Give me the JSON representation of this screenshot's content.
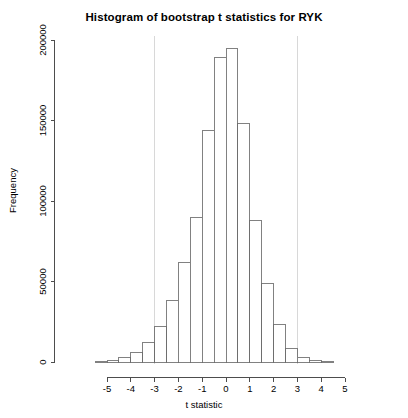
{
  "chart_data": {
    "type": "bar",
    "title": "Histogram of bootstrap t statistics for RYK",
    "xlabel": "t statistic",
    "ylabel": "Frequency",
    "xlim": [
      -5.6,
      5.6
    ],
    "ylim": [
      0,
      205000
    ],
    "grid": false,
    "legend": null,
    "bin_width": 0.5,
    "x_ticks": [
      -5,
      -4,
      -3,
      -2,
      -1,
      0,
      1,
      2,
      3,
      4,
      5
    ],
    "x_tick_labels": [
      "-5",
      "-4",
      "-3",
      "-2",
      "-1",
      "0",
      "1",
      "2",
      "3",
      "4",
      "5"
    ],
    "y_ticks": [
      0,
      50000,
      100000,
      150000,
      200000
    ],
    "y_tick_labels": [
      "0",
      "50000",
      "100000",
      "150000",
      "200000"
    ],
    "annotations": [
      {
        "name": "critical-value-line-lower",
        "type": "vline",
        "x": -3.0,
        "color": "#d8d8d8"
      },
      {
        "name": "critical-value-line-upper",
        "type": "vline",
        "x": 3.0,
        "color": "#d8d8d8"
      }
    ],
    "bin_edges": [
      -5.5,
      -5.0,
      -4.5,
      -4.0,
      -3.5,
      -3.0,
      -2.5,
      -2.0,
      -1.5,
      -1.0,
      -0.5,
      0.0,
      0.5,
      1.0,
      1.5,
      2.0,
      2.5,
      3.0,
      3.5,
      4.0,
      4.5
    ],
    "bin_centers": [
      -5.25,
      -4.75,
      -4.25,
      -3.75,
      -3.25,
      -2.75,
      -2.25,
      -1.75,
      -1.25,
      -0.75,
      -0.25,
      0.25,
      0.75,
      1.25,
      1.75,
      2.25,
      2.75,
      3.25,
      3.75,
      4.25
    ],
    "values": [
      300,
      900,
      2500,
      6000,
      12000,
      22000,
      38000,
      62000,
      90000,
      144000,
      189000,
      195000,
      148000,
      88000,
      49000,
      23000,
      8500,
      3000,
      900,
      300
    ],
    "categories": [
      "-5.25",
      "-4.75",
      "-4.25",
      "-3.75",
      "-3.25",
      "-2.75",
      "-2.25",
      "-1.75",
      "-1.25",
      "-0.75",
      "-0.25",
      "0.25",
      "0.75",
      "1.25",
      "1.75",
      "2.25",
      "2.75",
      "3.25",
      "3.75",
      "4.25"
    ]
  },
  "plot": {
    "title": "Histogram of bootstrap t statistics for RYK",
    "xlabel": "t statistic",
    "ylabel": "Frequency",
    "axis_color": "#4d4d4d",
    "bar_stroke": "#6b6b6b",
    "bar_fill": "#ffffff",
    "vline_color": "#d8d8d8",
    "background": "#ffffff"
  }
}
